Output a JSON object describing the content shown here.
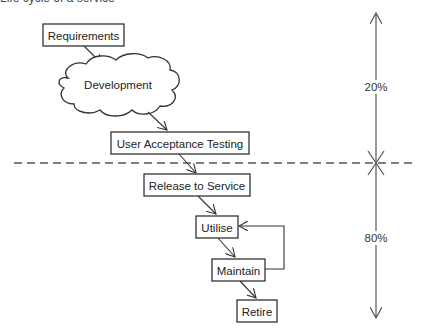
{
  "title_clipped": "Life cycle of a service",
  "stages": {
    "requirements": "Requirements",
    "development": "Development",
    "uat": "User Acceptance Testing",
    "release": "Release to Service",
    "utilise": "Utilise",
    "maintain": "Maintain",
    "retire": "Retire"
  },
  "proportions": {
    "upper_label": "20%",
    "lower_label": "80%",
    "upper_value": 0.2,
    "lower_value": 0.8
  }
}
